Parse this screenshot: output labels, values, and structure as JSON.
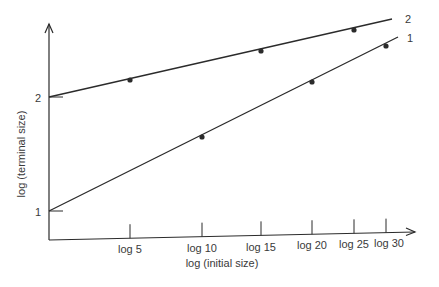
{
  "chart_data": {
    "type": "line",
    "title": "",
    "xlabel": "log (initial size)",
    "ylabel": "log (terminal size)",
    "x_ticks": [
      "log 5",
      "log 10",
      "log 15",
      "log 20",
      "log 25",
      "log 30"
    ],
    "y_ticks": [
      "1",
      "2"
    ],
    "grid": false,
    "legend": "inline line labels at right end",
    "series": [
      {
        "name": "1",
        "start_y": 1,
        "x": [
          "log 10",
          "log 20",
          "log 30"
        ],
        "marked_points_y": [
          1.65,
          2.13,
          2.45
        ],
        "values_at_ticks": [
          1.34,
          1.65,
          1.9,
          2.13,
          2.32,
          2.45
        ]
      },
      {
        "name": "2",
        "start_y": 2,
        "x": [
          "log 5",
          "log 15",
          "log 25"
        ],
        "marked_points_y": [
          2.15,
          2.4,
          2.59
        ],
        "values_at_ticks": [
          2.15,
          2.29,
          2.4,
          2.51,
          2.59,
          2.65
        ]
      }
    ],
    "ylim": [
      0.75,
      2.85
    ]
  },
  "geometry": {
    "axis_origin": [
      49,
      240
    ],
    "x_axis_end": [
      415,
      232
    ],
    "y_axis_top": [
      49,
      24
    ],
    "y_pixel": {
      "1": 211,
      "2": 97
    },
    "tick_x": [
      130,
      202,
      261,
      312,
      354,
      386
    ],
    "line1": {
      "start": [
        49,
        211
      ],
      "end": [
        398,
        37
      ],
      "dots": [
        [
          202,
          137
        ],
        [
          312,
          82
        ],
        [
          386,
          46
        ]
      ],
      "label_pos": [
        407,
        42
      ]
    },
    "line2": {
      "start": [
        49,
        97
      ],
      "end": [
        392,
        19
      ],
      "dots": [
        [
          130,
          80
        ],
        [
          261,
          51
        ],
        [
          354,
          30
        ]
      ],
      "label_pos": [
        405,
        23
      ]
    }
  },
  "colors": {
    "ink": "#2b2b2b",
    "label": "#3a3a3a",
    "background": "#ffffff"
  }
}
